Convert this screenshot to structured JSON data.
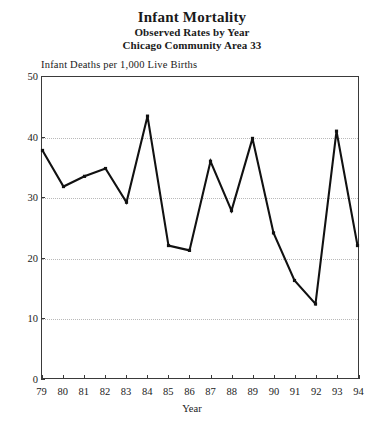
{
  "figure": {
    "title": "Infant Mortality",
    "subtitle_1": "Observed Rates by Year",
    "subtitle_2": "Chicago Community Area 33",
    "axis_note": "Infant Deaths per 1,000 Live Births",
    "line_color": "#111111",
    "grid_color": "#b9b9b9",
    "frame_color": "#3a3a3a"
  },
  "chart_data": {
    "type": "line",
    "title": "Infant Mortality",
    "subtitle": "Observed Rates by Year — Chicago Community Area 33",
    "xlabel": "Year",
    "ylabel": "Infant Deaths per 1,000 Live Births",
    "categories": [
      "79",
      "80",
      "81",
      "82",
      "83",
      "84",
      "85",
      "86",
      "87",
      "88",
      "89",
      "90",
      "91",
      "92",
      "93",
      "94"
    ],
    "values": [
      37.8,
      31.8,
      33.5,
      34.8,
      29.2,
      43.5,
      22.0,
      21.2,
      36.0,
      27.8,
      39.8,
      24.1,
      16.2,
      12.3,
      41.0,
      22.0
    ],
    "ylim": [
      0,
      50
    ],
    "yticks": [
      0,
      10,
      20,
      30,
      40,
      50
    ],
    "xticks": [
      "79",
      "80",
      "81",
      "82",
      "83",
      "84",
      "85",
      "86",
      "87",
      "88",
      "89",
      "90",
      "91",
      "92",
      "93",
      "94"
    ],
    "grid": "horizontal-dotted",
    "legend": "none",
    "marker": "square"
  }
}
